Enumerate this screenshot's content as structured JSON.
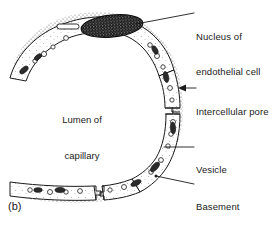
{
  "figure": {
    "panel_letter": "(b)",
    "caption_subject": "Capillary cross-section",
    "background_color": "#ffffff",
    "ink_color": "#1a1a1a"
  },
  "lumen": {
    "line1": "Lumen of",
    "line2": "capillary"
  },
  "labels": [
    {
      "id": "nucleus",
      "line1": "Nucleus of",
      "line2": "endothelial cell",
      "leader": "line",
      "target": "nucleus-of-endothelial-cell"
    },
    {
      "id": "pore",
      "line1": "Intercellular pore",
      "line2": "",
      "leader": "arrow",
      "target": "intercellular-pore"
    },
    {
      "id": "vesicle",
      "line1": "Vesicle",
      "line2": "",
      "leader": "line",
      "target": "vesicle"
    },
    {
      "id": "basement",
      "line1": "Basement",
      "line2": "membrane",
      "leader": "line",
      "target": "basement-membrane"
    }
  ],
  "structures": {
    "nucleus_fill": "#111111",
    "wall_fill": "#ffffff",
    "stipple_color": "#555555"
  }
}
